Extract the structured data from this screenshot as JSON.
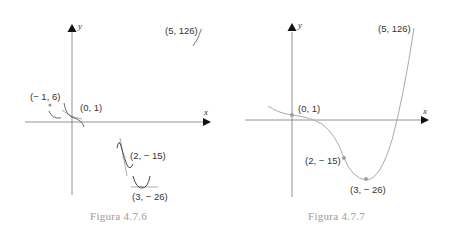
{
  "figures": [
    {
      "caption": "Figura 4.7.6",
      "axes": {
        "x_label": "x",
        "y_label": "y"
      },
      "points": [
        {
          "label": "(5, 126)",
          "x": 5,
          "y": 126
        },
        {
          "label": "(− 1, 6)",
          "x": -1,
          "y": 6
        },
        {
          "label": "(0, 1)",
          "x": 0,
          "y": 1
        },
        {
          "label": "(2, − 15)",
          "x": 2,
          "y": -15
        },
        {
          "label": "(3, − 26)",
          "x": 3,
          "y": -26
        }
      ],
      "description": "Local curve fragments sketched at each known point"
    },
    {
      "caption": "Figura 4.7.7",
      "axes": {
        "x_label": "x",
        "y_label": "y"
      },
      "points": [
        {
          "label": "(5, 126)",
          "x": 5,
          "y": 126
        },
        {
          "label": "(0, 1)",
          "x": 0,
          "y": 1
        },
        {
          "label": "(2, − 15)",
          "x": 2,
          "y": -15
        },
        {
          "label": "(3, − 26)",
          "x": 3,
          "y": -26
        }
      ],
      "description": "Complete curve through the known points"
    }
  ],
  "colors": {
    "axis": "#777777",
    "curve": "#aaaaaa",
    "point": "#a0a0a0",
    "text": "#333333",
    "caption": "#9a9a9a"
  }
}
